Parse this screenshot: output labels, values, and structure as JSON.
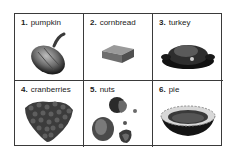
{
  "worksheet": {
    "items": [
      {
        "number": "1.",
        "label": "pumpkin",
        "icon": "pumpkin-icon"
      },
      {
        "number": "2.",
        "label": "cornbread",
        "icon": "cornbread-icon"
      },
      {
        "number": "3.",
        "label": "turkey",
        "icon": "turkey-icon"
      },
      {
        "number": "4.",
        "label": "cranberries",
        "icon": "cranberries-icon"
      },
      {
        "number": "5.",
        "label": "nuts",
        "icon": "nuts-icon"
      },
      {
        "number": "6.",
        "label": "pie",
        "icon": "pie-icon"
      }
    ],
    "colors": {
      "border": "#3a3a3a",
      "text": "#222222",
      "background": "#ffffff"
    }
  }
}
